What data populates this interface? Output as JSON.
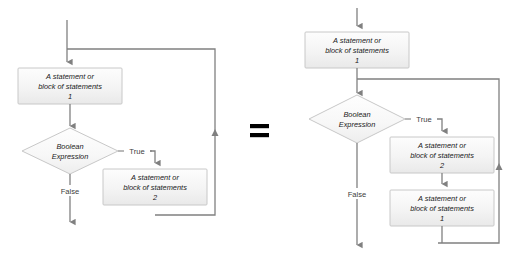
{
  "diagram": {
    "equals_symbol": "=",
    "colors": {
      "box_fill": "#f2f2f2",
      "box_fill_light": "#fbfbfb",
      "box_border": "#c8c8c8",
      "diamond_fill": "#fafafa",
      "diamond_border": "#c8c8c8",
      "connector": "#808080",
      "connector_dark": "#595959",
      "text": "#1a1a1a",
      "label_text": "#404040"
    },
    "node_text": {
      "line1": "A statement or",
      "line2": "block of statements",
      "num1": "1",
      "num2": "2",
      "decision_line1": "Boolean",
      "decision_line2": "Expression"
    },
    "edge_labels": {
      "true": "True",
      "false": "False"
    },
    "left_flowchart": {
      "name": "while-loop-flowchart",
      "nodes": [
        {
          "id": "l-process-1",
          "type": "process",
          "line1": "A statement or",
          "line2": "block of statements",
          "line3": "1"
        },
        {
          "id": "l-decision",
          "type": "decision",
          "line1": "Boolean",
          "line2": "Expression"
        },
        {
          "id": "l-process-2",
          "type": "process",
          "line1": "A statement or",
          "line2": "block of statements",
          "line3": "2"
        }
      ],
      "edges": [
        {
          "from": "entry",
          "to": "l-process-1",
          "label": ""
        },
        {
          "from": "l-process-1",
          "to": "l-decision",
          "label": ""
        },
        {
          "from": "l-decision",
          "to": "l-process-2",
          "label": "True"
        },
        {
          "from": "l-decision",
          "to": "exit",
          "label": "False"
        },
        {
          "from": "l-process-2",
          "to": "l-process-1",
          "label": ""
        }
      ]
    },
    "right_flowchart": {
      "name": "unrolled-loop-flowchart",
      "nodes": [
        {
          "id": "r-process-1a",
          "type": "process",
          "line1": "A statement or",
          "line2": "block of statements",
          "line3": "1"
        },
        {
          "id": "r-decision",
          "type": "decision",
          "line1": "Boolean",
          "line2": "Expression"
        },
        {
          "id": "r-process-2",
          "type": "process",
          "line1": "A statement or",
          "line2": "block of statements",
          "line3": "2"
        },
        {
          "id": "r-process-1b",
          "type": "process",
          "line1": "A statement or",
          "line2": "block of statements",
          "line3": "1"
        }
      ],
      "edges": [
        {
          "from": "entry",
          "to": "r-process-1a",
          "label": ""
        },
        {
          "from": "r-process-1a",
          "to": "r-decision",
          "label": ""
        },
        {
          "from": "r-decision",
          "to": "r-process-2",
          "label": "True"
        },
        {
          "from": "r-decision",
          "to": "exit",
          "label": "False"
        },
        {
          "from": "r-process-2",
          "to": "r-process-1b",
          "label": ""
        },
        {
          "from": "r-process-1b",
          "to": "r-decision",
          "label": ""
        }
      ]
    }
  }
}
